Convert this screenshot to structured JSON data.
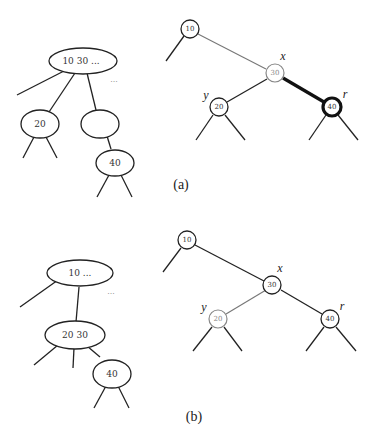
{
  "figure_a": {
    "caption": "(a)",
    "btree": {
      "root": {
        "keys_label": "10   30   ...",
        "extra_dots": "..."
      },
      "child_20": {
        "label": "20"
      },
      "child_empty": {
        "label": ""
      },
      "child_40": {
        "label": "40"
      }
    },
    "rbtree": {
      "node_10": {
        "label": "10"
      },
      "node_30": {
        "label": "30",
        "var": "x",
        "style": "gray"
      },
      "node_20": {
        "label": "20",
        "var": "y"
      },
      "node_40": {
        "label": "40",
        "var": "r",
        "style": "thick"
      },
      "thick_edge": "30-40"
    }
  },
  "figure_b": {
    "caption": "(b)",
    "btree": {
      "root": {
        "keys_label": "10   ...",
        "extra_dots": "..."
      },
      "child_20_30": {
        "keys_label": "20   30"
      },
      "child_40": {
        "label": "40"
      }
    },
    "rbtree": {
      "node_10": {
        "label": "10"
      },
      "node_30": {
        "label": "30",
        "var": "x"
      },
      "node_20": {
        "label": "20",
        "var": "y",
        "style": "gray"
      },
      "node_40": {
        "label": "40",
        "var": "r"
      }
    }
  }
}
